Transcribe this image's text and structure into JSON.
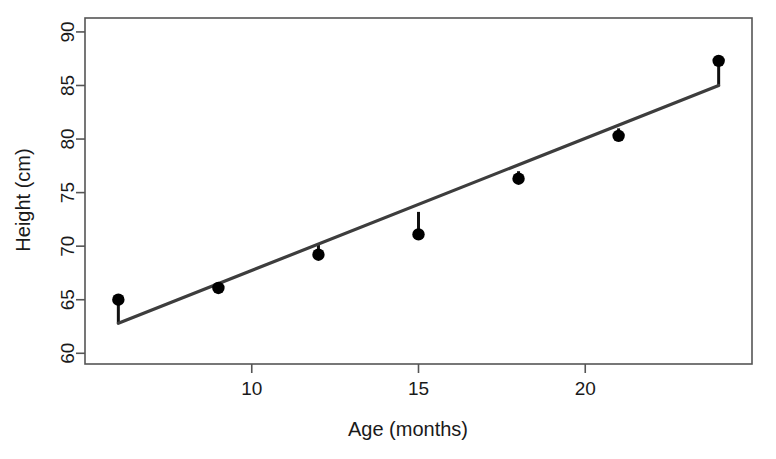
{
  "chart_data": {
    "type": "scatter",
    "title": "",
    "xlabel": "Age (months)",
    "ylabel": "Height (cm)",
    "x": [
      6,
      9,
      12,
      15,
      18,
      21,
      24
    ],
    "y": [
      65.0,
      66.1,
      69.2,
      71.1,
      76.3,
      80.3,
      87.3
    ],
    "series": [
      {
        "name": "observations",
        "x": [
          6,
          9,
          12,
          15,
          18,
          21,
          24
        ],
        "values": [
          65.0,
          66.1,
          69.2,
          71.1,
          76.3,
          80.3,
          87.3
        ]
      },
      {
        "name": "fitted regression line",
        "type": "line",
        "x": [
          6,
          24
        ],
        "values": [
          62.8,
          85.0
        ]
      }
    ],
    "residual_segments": [
      {
        "x": 6,
        "y_observed": 65.0,
        "y_fitted": 62.8
      },
      {
        "x": 9,
        "y_observed": 66.1,
        "y_fitted": 66.5
      },
      {
        "x": 12,
        "y_observed": 69.2,
        "y_fitted": 70.2
      },
      {
        "x": 15,
        "y_observed": 71.1,
        "y_fitted": 73.2
      },
      {
        "x": 18,
        "y_observed": 76.3,
        "y_fitted": 77.0
      },
      {
        "x": 21,
        "y_observed": 80.3,
        "y_fitted": 81.0
      },
      {
        "x": 24,
        "y_observed": 87.3,
        "y_fitted": 85.0
      }
    ],
    "xlim": [
      5.0,
      25.0
    ],
    "ylim": [
      59.0,
      91.3
    ],
    "xticks": [
      10,
      15,
      20
    ],
    "yticks": [
      60,
      65,
      70,
      75,
      80,
      85,
      90
    ],
    "xtick_labels": [
      "10",
      "15",
      "20"
    ],
    "ytick_labels": [
      "60",
      "65",
      "70",
      "75",
      "80",
      "85",
      "90"
    ],
    "grid": false,
    "legend": "none",
    "colors": {
      "point": "#000000",
      "regression": "#3d3d3d",
      "residual": "#111111",
      "axis": "#555555",
      "background": "#ffffff"
    }
  }
}
